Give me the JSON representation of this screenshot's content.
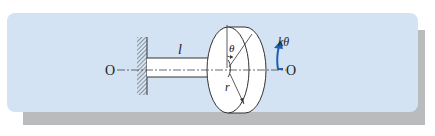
{
  "figure": {
    "panel_color": "#d3e3f3",
    "shadow_color": "#b9bbbd",
    "arrow_color": "#1f5fae"
  },
  "labels": {
    "axis_left": "O",
    "axis_right": "O",
    "shaft_length": "l",
    "angle": "θ",
    "radius": "r",
    "torque": "kθ"
  }
}
